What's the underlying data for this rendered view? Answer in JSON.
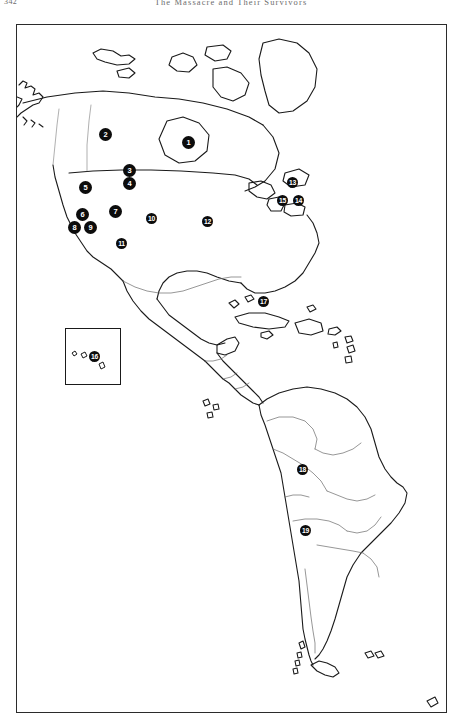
{
  "page": {
    "folio": "342",
    "running_head": "The Massacre and Their Survivors",
    "width": 462,
    "height": 728,
    "background_color": "#ffffff",
    "ink_color": "#1a1a1a"
  },
  "figure": {
    "name": "americas-locator-map",
    "frame": {
      "x": 16,
      "y": 24,
      "width": 431,
      "height": 689
    },
    "border_color": "#2b2b2b",
    "marker_fill": "#0c0c0c",
    "marker_text_color": "#ffffff",
    "inset": {
      "label": "hawaii-inset",
      "x": 48,
      "y": 303,
      "width": 56,
      "height": 57
    }
  },
  "markers": [
    {
      "id": 1,
      "label": "1",
      "x": 171,
      "y": 117,
      "region": "northwest-canada"
    },
    {
      "id": 2,
      "label": "2",
      "x": 100,
      "y": 128,
      "region": "western-canada"
    },
    {
      "id": 3,
      "label": "3",
      "x": 122,
      "y": 165,
      "region": "northern-rockies"
    },
    {
      "id": 4,
      "label": "4",
      "x": 122,
      "y": 178,
      "region": "central-rockies"
    },
    {
      "id": 5,
      "label": "5",
      "x": 82,
      "y": 182,
      "region": "pacific-northwest"
    },
    {
      "id": 6,
      "label": "6",
      "x": 79,
      "y": 203,
      "region": "northern-california"
    },
    {
      "id": 7,
      "label": "7",
      "x": 112,
      "y": 206,
      "region": "great-basin"
    },
    {
      "id": 8,
      "label": "8",
      "x": 71,
      "y": 218,
      "region": "central-california"
    },
    {
      "id": 9,
      "label": "9",
      "x": 87,
      "y": 218,
      "region": "southern-sierra"
    },
    {
      "id": 10,
      "label": "10",
      "x": 148,
      "y": 212,
      "region": "southern-plains"
    },
    {
      "id": 11,
      "label": "11",
      "x": 118,
      "y": 237,
      "region": "southwest-desert"
    },
    {
      "id": 12,
      "label": "12",
      "x": 204,
      "y": 215,
      "region": "southeast"
    },
    {
      "id": 13,
      "label": "13",
      "x": 288,
      "y": 178,
      "region": "great-lakes-east"
    },
    {
      "id": 14,
      "label": "14",
      "x": 294,
      "y": 195,
      "region": "new-england"
    },
    {
      "id": 15,
      "label": "15",
      "x": 278,
      "y": 195,
      "region": "mid-atlantic"
    },
    {
      "id": 16,
      "label": "16",
      "x": 90,
      "y": 352,
      "region": "hawaii-inset"
    },
    {
      "id": 17,
      "label": "17",
      "x": 259,
      "y": 297,
      "region": "caribbean"
    },
    {
      "id": 18,
      "label": "18",
      "x": 298,
      "y": 465,
      "region": "central-andes"
    },
    {
      "id": 19,
      "label": "19",
      "x": 301,
      "y": 526,
      "region": "southern-andes"
    }
  ]
}
